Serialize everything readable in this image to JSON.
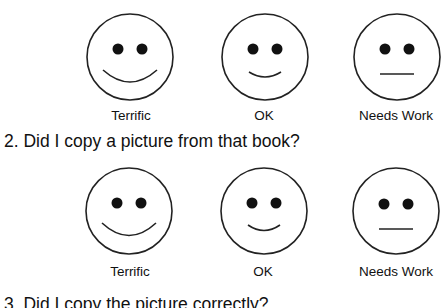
{
  "questions": [
    {
      "number": "1.",
      "text": "",
      "cut_off": true,
      "options": [
        {
          "label": "Terrific",
          "mood": "big-smile"
        },
        {
          "label": "OK",
          "mood": "small-smile"
        },
        {
          "label": "Needs Work",
          "mood": "neutral"
        }
      ]
    },
    {
      "number": "2.",
      "text": "2. Did I copy a picture from that book?",
      "options": [
        {
          "label": "Terrific",
          "mood": "big-smile"
        },
        {
          "label": "OK",
          "mood": "small-smile"
        },
        {
          "label": "Needs Work",
          "mood": "neutral"
        }
      ]
    },
    {
      "number": "3.",
      "text": "3. Did I copy the picture correctly?",
      "cut_off": true
    }
  ]
}
